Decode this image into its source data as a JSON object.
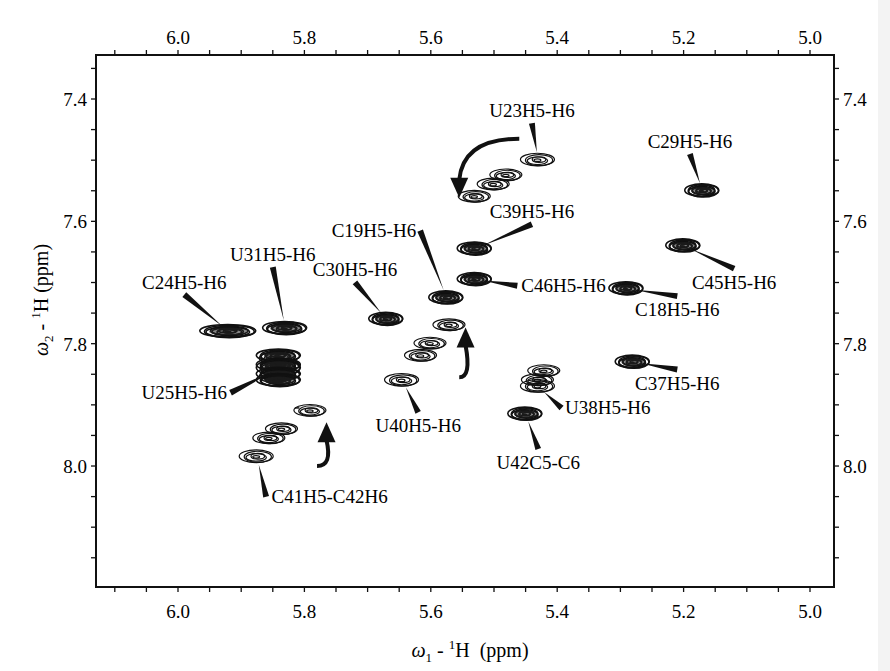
{
  "chart_data": {
    "type": "scatter",
    "subtype": "2D NMR contour spectrum (H5-H6 region)",
    "title": "",
    "xlabel": "ω1 - 1H  (ppm)",
    "ylabel": "ω2 - 1H (ppm)",
    "xlabel_parts": {
      "symbol": "ω",
      "sub": "1",
      "sup": "1",
      "rest": "H  (ppm)"
    },
    "ylabel_parts": {
      "symbol": "ω",
      "sub": "2",
      "sup": "1",
      "rest": "H (ppm)"
    },
    "xlim": [
      6.11,
      4.97
    ],
    "ylim": [
      7.33,
      8.2
    ],
    "x_reversed": true,
    "y_reversed": true,
    "x_ticks": [
      "6.0",
      "5.8",
      "5.6",
      "5.4",
      "5.2",
      "5.0"
    ],
    "y_ticks": [
      "7.4",
      "7.6",
      "7.8",
      "8.0"
    ],
    "grid": false,
    "legend": null,
    "peaks": [
      {
        "label": "U23H5-H6",
        "x": 5.43,
        "y": 7.5,
        "label_pos": [
          5.44,
          7.43
        ],
        "style": "open"
      },
      {
        "label": "C29H5-H6",
        "x": 5.17,
        "y": 7.55,
        "label_pos": [
          5.19,
          7.48
        ],
        "style": "filled"
      },
      {
        "label": "C39H5-H6",
        "x": 5.53,
        "y": 7.645,
        "label_pos": [
          5.44,
          7.595
        ],
        "style": "filled"
      },
      {
        "label": "C45H5-H6",
        "x": 5.2,
        "y": 7.64,
        "label_pos": [
          5.12,
          7.71
        ],
        "style": "filled"
      },
      {
        "label": "C19H5-H6",
        "x": 5.575,
        "y": 7.725,
        "label_pos": [
          5.69,
          7.625
        ],
        "style": "filled"
      },
      {
        "label": "C46H5-H6",
        "x": 5.53,
        "y": 7.695,
        "label_pos": [
          5.39,
          7.715
        ],
        "style": "filled"
      },
      {
        "label": "C18H5-H6",
        "x": 5.29,
        "y": 7.71,
        "label_pos": [
          5.21,
          7.755
        ],
        "style": "filled"
      },
      {
        "label": "C30H5-H6",
        "x": 5.67,
        "y": 7.76,
        "label_pos": [
          5.72,
          7.69
        ],
        "style": "filled"
      },
      {
        "label": "U31H5-H6",
        "x": 5.83,
        "y": 7.775,
        "label_pos": [
          5.85,
          7.665
        ],
        "style": "filled"
      },
      {
        "label": "C24H5-H6",
        "x": 5.92,
        "y": 7.78,
        "label_pos": [
          5.99,
          7.71
        ],
        "style": "filled"
      },
      {
        "label": "C37H5-H6",
        "x": 5.28,
        "y": 7.83,
        "label_pos": [
          5.21,
          7.875
        ],
        "style": "filled"
      },
      {
        "label": "U25H5-H6",
        "x": 5.84,
        "y": 7.84,
        "label_pos": [
          5.99,
          7.89
        ],
        "style": "filled"
      },
      {
        "label": "U40H5-H6",
        "x": 5.645,
        "y": 7.86,
        "label_pos": [
          5.62,
          7.945
        ],
        "style": "open"
      },
      {
        "label": "U38H5-H6",
        "x": 5.43,
        "y": 7.87,
        "label_pos": [
          5.32,
          7.915
        ],
        "style": "open"
      },
      {
        "label": "U42C5-C6",
        "x": 5.45,
        "y": 7.915,
        "label_pos": [
          5.43,
          8.005
        ],
        "style": "filled"
      },
      {
        "label": "C41H5-C42H6",
        "x": 5.875,
        "y": 7.985,
        "label_pos": [
          5.76,
          8.06
        ],
        "style": "open"
      }
    ],
    "unlabeled_peaks": [
      {
        "x": 5.48,
        "y": 7.525
      },
      {
        "x": 5.5,
        "y": 7.54
      },
      {
        "x": 5.53,
        "y": 7.56
      },
      {
        "x": 5.57,
        "y": 7.77
      },
      {
        "x": 5.6,
        "y": 7.8
      },
      {
        "x": 5.615,
        "y": 7.82
      },
      {
        "x": 5.42,
        "y": 7.845
      },
      {
        "x": 5.43,
        "y": 7.86
      },
      {
        "x": 5.845,
        "y": 7.825
      },
      {
        "x": 5.845,
        "y": 7.855
      },
      {
        "x": 5.79,
        "y": 7.91
      },
      {
        "x": 5.835,
        "y": 7.94
      },
      {
        "x": 5.855,
        "y": 7.955
      }
    ],
    "arrows": [
      {
        "from": [
          5.46,
          7.465
        ],
        "to": [
          5.555,
          7.555
        ],
        "note": "curved arrow toward shifted U23 peaks"
      },
      {
        "from": [
          5.555,
          7.855
        ],
        "to": [
          5.545,
          7.78
        ],
        "note": "curved arrow from U40 upward"
      },
      {
        "from": [
          5.78,
          8.0
        ],
        "to": [
          5.765,
          7.935
        ],
        "note": "curved arrow from C41 upward"
      }
    ]
  }
}
